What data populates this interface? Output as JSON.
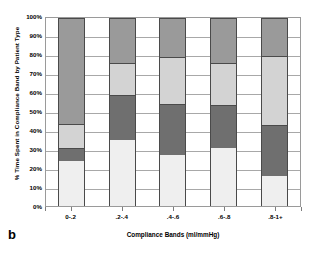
{
  "panel": {
    "letter": "b"
  },
  "chart_data": {
    "type": "bar",
    "variant": "stacked-100-percent",
    "title": "",
    "xlabel": "Compliance Bands (ml/mmHg)",
    "ylabel": "% Time Spent in Compliance Band by Patient Type",
    "categories": [
      "0-.2",
      ".2-.4",
      ".4-.6",
      ".6-.8",
      ".8-1+"
    ],
    "ylim": [
      0,
      100
    ],
    "yticks": [
      "0%",
      "10%",
      "20%",
      "30%",
      "40%",
      "50%",
      "60%",
      "70%",
      "80%",
      "90%",
      "100%"
    ],
    "ytick_values": [
      0,
      10,
      20,
      30,
      40,
      50,
      60,
      70,
      80,
      90,
      100
    ],
    "grid": true,
    "legend": "none",
    "series": [
      {
        "name": "series-1",
        "color": "#efefef",
        "values": [
          24,
          35,
          27,
          31,
          16
        ]
      },
      {
        "name": "series-2",
        "color": "#6f6f6f",
        "values": [
          7,
          24,
          27,
          23,
          27
        ]
      },
      {
        "name": "series-3",
        "color": "#d3d3d3",
        "values": [
          12.5,
          17,
          25,
          22,
          37
        ]
      },
      {
        "name": "series-4",
        "color": "#9a9a9a",
        "values": [
          56.5,
          24,
          21,
          24,
          20
        ]
      }
    ]
  },
  "colors": {
    "axis": "#7d7d7d",
    "gridline": "#a8a8a8",
    "bar_outline": "#4a4a4a",
    "background": "#ffffff",
    "text": "#000000"
  }
}
